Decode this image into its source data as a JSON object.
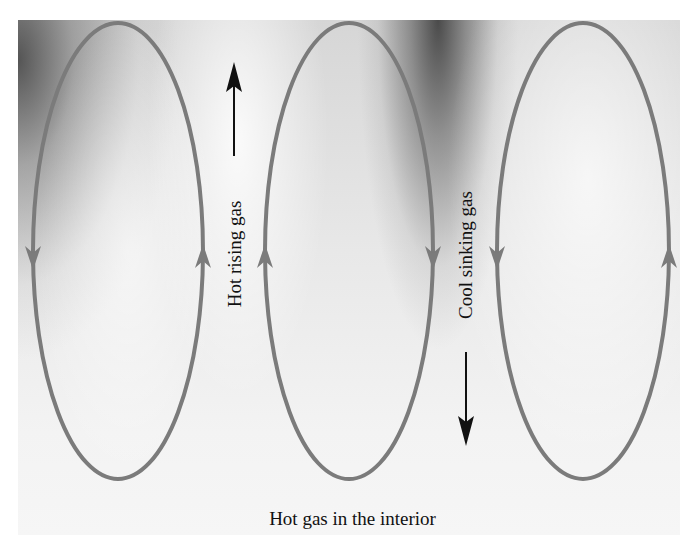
{
  "diagram": {
    "labels": {
      "rising": "Hot rising gas",
      "sinking": "Cool sinking gas",
      "interior": "Hot gas in the interior"
    },
    "cells": [
      {
        "name": "left-cell",
        "cx": 118,
        "rx": 85,
        "left_flow": "down",
        "right_flow": "up"
      },
      {
        "name": "middle-cell",
        "cx": 349,
        "rx": 84,
        "left_flow": "up",
        "right_flow": "down"
      },
      {
        "name": "right-cell",
        "cx": 583,
        "rx": 86,
        "left_flow": "down",
        "right_flow": "up"
      }
    ],
    "arrows": {
      "rising": {
        "direction": "up"
      },
      "sinking": {
        "direction": "down"
      }
    },
    "colors": {
      "loop_stroke": "#7b7b7b",
      "arrow": "#111111",
      "background_dark": "#3a3a3a",
      "background_light": "#f4f4f4"
    }
  }
}
